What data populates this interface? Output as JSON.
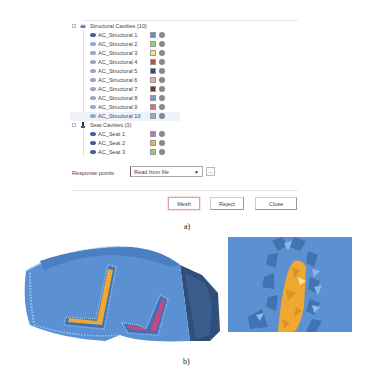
{
  "dialog": {
    "tree": {
      "groups": [
        {
          "label": "Structural Cavities (10)",
          "icon": "structural-cavity-icon",
          "items": [
            {
              "label": "AC_Structural 1",
              "color": "#5b8fd6"
            },
            {
              "label": "AC_Structural 2",
              "color": "#8fce7a"
            },
            {
              "label": "AC_Structural 3",
              "color": "#f2ee6a"
            },
            {
              "label": "AC_Structural 4",
              "color": "#c0504d"
            },
            {
              "label": "AC_Structural 5",
              "color": "#2e4a8e"
            },
            {
              "label": "AC_Structural 6",
              "color": "#f0a890"
            },
            {
              "label": "AC_Structural 7",
              "color": "#6b3a2a"
            },
            {
              "label": "AC_Structural 8",
              "color": "#6f9fd8"
            },
            {
              "label": "AC_Structural 9",
              "color": "#e86a7a"
            },
            {
              "label": "AC_Structural 10",
              "color": "#9aa8d0"
            }
          ]
        },
        {
          "label": "Seat Cavities (3)",
          "icon": "seat-cavity-icon",
          "items": [
            {
              "label": "AC_Seat 1",
              "color": "#b07cc0"
            },
            {
              "label": "AC_Seat 2",
              "color": "#f0b050"
            },
            {
              "label": "AC_Seat 3",
              "color": "#90c880"
            }
          ]
        }
      ]
    },
    "response_points": {
      "label": "Response points:",
      "value": "Read from file",
      "browse_label": "..."
    },
    "buttons": {
      "mesh": "Mesh",
      "reject": "Reject",
      "close": "Close"
    }
  },
  "captions": {
    "a": "a)",
    "b": "b)"
  },
  "colors": {
    "mesh_blue": "#5b90d3",
    "cavity_orange": "#f0a830",
    "cavity_pink": "#c8487a",
    "mesh_button_border": "#e0a0a8"
  }
}
